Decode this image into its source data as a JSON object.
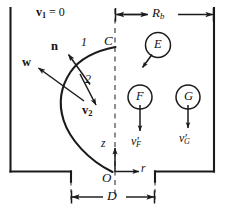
{
  "figure": {
    "type": "schematic-diagram",
    "stroke_color": "#1a1a1a",
    "background_color": "#ffffff"
  },
  "labels": {
    "v1_zero": {
      "vector": "v",
      "sub": "1",
      "rest": " = 0"
    },
    "normal_vector": "n",
    "w_vector": "w",
    "v2_vector": {
      "vector": "v",
      "sub": "2"
    },
    "region_one": "1",
    "region_two": "2",
    "point_C": "C",
    "point_O": "O",
    "axis_z": "z",
    "axis_r": "r",
    "dim_Rb": {
      "base": "R",
      "sub": "b"
    },
    "dim_D": "D",
    "bubble_E": "E",
    "bubble_F": "F",
    "bubble_G": "G",
    "vel_F": {
      "base": "v",
      "prime": "′",
      "sub": "F"
    },
    "vel_G": {
      "base": "v",
      "prime": "′",
      "sub": "G"
    }
  },
  "elements": {
    "walls": "container-outline",
    "centerline": "dashed-axis-of-symmetry",
    "interface": "curved-interface-from-C-to-O",
    "dimension_lines": [
      "Rb-top-dimension",
      "D-bottom-dimension"
    ],
    "bubbles": [
      "E",
      "F",
      "G"
    ],
    "vectors": [
      "n",
      "w",
      "v2",
      "E-arrow",
      "F-arrow",
      "G-arrow",
      "z-axis",
      "r-axis"
    ]
  }
}
